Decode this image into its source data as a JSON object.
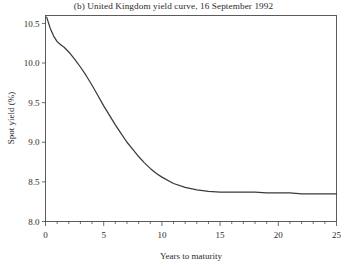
{
  "chart_data": {
    "type": "line",
    "title": "(b) United Kingdom yield curve, 16 September 1992",
    "xlabel": "Years to maturity",
    "ylabel": "Spot yield (%)",
    "xlim": [
      0,
      25
    ],
    "ylim": [
      8.0,
      10.6
    ],
    "grid": false,
    "legend": null,
    "xticks": [
      0,
      5,
      10,
      15,
      20,
      25
    ],
    "xtick_labels": [
      "0",
      "5",
      "10",
      "15",
      "20",
      "25"
    ],
    "x_minor_tick_interval": 1,
    "yticks": [
      8.0,
      8.5,
      9.0,
      9.5,
      10.0,
      10.5
    ],
    "ytick_labels": [
      "8.0",
      "8.5",
      "9.0",
      "9.5",
      "10.0",
      "10.5"
    ],
    "series": [
      {
        "name": "UK spot yield curve",
        "color": "#3a3a3a",
        "x": [
          0.1,
          0.4,
          0.7,
          1.0,
          1.3,
          1.6,
          2.0,
          2.5,
          3.0,
          3.5,
          4.0,
          4.5,
          5.0,
          5.5,
          6.0,
          6.5,
          7.0,
          7.5,
          8.0,
          8.5,
          9.0,
          9.5,
          10.0,
          11.0,
          12.0,
          13.0,
          14.0,
          15.0,
          16.0,
          17.0,
          18.0,
          19.0,
          20.0,
          21.0,
          22.0,
          23.0,
          24.0,
          25.0
        ],
        "y": [
          10.58,
          10.44,
          10.34,
          10.27,
          10.23,
          10.2,
          10.14,
          10.05,
          9.95,
          9.84,
          9.72,
          9.59,
          9.46,
          9.34,
          9.22,
          9.11,
          9.0,
          8.91,
          8.82,
          8.74,
          8.67,
          8.61,
          8.56,
          8.48,
          8.43,
          8.4,
          8.38,
          8.37,
          8.37,
          8.37,
          8.37,
          8.36,
          8.36,
          8.36,
          8.35,
          8.35,
          8.35,
          8.35
        ]
      }
    ]
  }
}
